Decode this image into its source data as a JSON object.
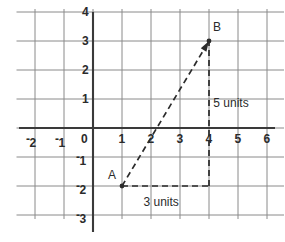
{
  "chart_data": {
    "type": "scatter",
    "title": "",
    "xlabel": "",
    "ylabel": "",
    "xlim": [
      -2.5,
      6.5
    ],
    "ylim": [
      -3.0,
      4.0
    ],
    "grid": true,
    "grid_spacing": 1,
    "legend": "none",
    "x_tick_labels": [
      "-2",
      "-1",
      "0",
      "1",
      "2",
      "3",
      "4",
      "5",
      "6"
    ],
    "x_tick_values": [
      -2,
      -1,
      0,
      1,
      2,
      3,
      4,
      5,
      6
    ],
    "y_tick_labels": [
      "4",
      "3",
      "2",
      "1",
      "0",
      "-1",
      "-2",
      "-3"
    ],
    "y_tick_values": [
      4,
      3,
      2,
      1,
      0,
      -1,
      -2,
      -3
    ],
    "points": [
      {
        "name": "A",
        "label": "A",
        "x": 1,
        "y": -2
      },
      {
        "name": "B",
        "label": "B",
        "x": 4,
        "y": 3
      }
    ],
    "segments": [
      {
        "name": "hypotenuse",
        "from": [
          1,
          -2
        ],
        "to": [
          4,
          3
        ],
        "style": "dashed",
        "arrow": "end"
      },
      {
        "name": "vertical-leg",
        "from": [
          4,
          -2
        ],
        "to": [
          4,
          3
        ],
        "style": "dashed",
        "arrow": "none"
      },
      {
        "name": "horizontal-leg",
        "from": [
          1,
          -2
        ],
        "to": [
          4,
          -2
        ],
        "style": "dashed",
        "arrow": "none"
      }
    ],
    "annotations": [
      {
        "name": "vertical-leg-measure",
        "text": "5 units",
        "x": 4.15,
        "y": 0.85
      },
      {
        "name": "horizontal-leg-measure",
        "text": "3 units",
        "x": 2.5,
        "y": -2.55
      }
    ]
  },
  "axes": {
    "x_ticks": [
      {
        "label": "2",
        "value": -2,
        "negative": true
      },
      {
        "label": "1",
        "value": -1,
        "negative": true
      },
      {
        "label": "0",
        "value": 0,
        "negative": false
      },
      {
        "label": "1",
        "value": 1,
        "negative": false
      },
      {
        "label": "2",
        "value": 2,
        "negative": false
      },
      {
        "label": "3",
        "value": 3,
        "negative": false
      },
      {
        "label": "4",
        "value": 4,
        "negative": false
      },
      {
        "label": "5",
        "value": 5,
        "negative": false
      },
      {
        "label": "6",
        "value": 6,
        "negative": false
      }
    ],
    "y_ticks": [
      {
        "label": "4",
        "value": 4,
        "negative": false
      },
      {
        "label": "3",
        "value": 3,
        "negative": false
      },
      {
        "label": "2",
        "value": 2,
        "negative": false
      },
      {
        "label": "1",
        "value": 1,
        "negative": false
      },
      {
        "label": "0",
        "value": 0,
        "negative": false
      },
      {
        "label": "1",
        "value": -1,
        "negative": true
      },
      {
        "label": "2",
        "value": -2,
        "negative": true
      },
      {
        "label": "3",
        "value": -3,
        "negative": true
      }
    ],
    "negative_sign": "-"
  },
  "labels": {
    "point_a": "A",
    "point_b": "B",
    "vertical_measure": "5 units",
    "horizontal_measure": "3 units"
  },
  "colors": {
    "background": "#ffffff",
    "grid_line": "#8a8a8a",
    "axis_line": "#3a3a3a",
    "dashed_line": "#2b2b2b",
    "text": "#2b2b2b"
  }
}
